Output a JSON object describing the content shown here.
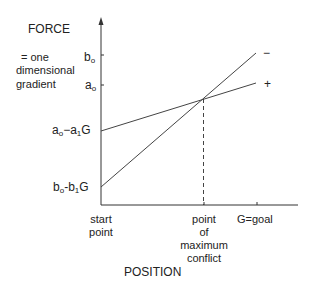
{
  "diagram": {
    "y_axis_title": "FORCE",
    "y_axis_subtitle": [
      "= one",
      "dimensional",
      "gradient"
    ],
    "x_axis_title": "POSITION",
    "y_ticks": {
      "b0": {
        "base": "b",
        "sub": "o"
      },
      "a0": {
        "base": "a",
        "sub": "o"
      },
      "a0_minus_a1G": {
        "p1": "a",
        "s1": "o",
        "mid": "−a",
        "s2": "1",
        "end": "G"
      },
      "b0_minus_b1G": {
        "p1": "b",
        "s1": "o",
        "mid": "-b",
        "s2": "1",
        "end": "G"
      }
    },
    "x_ticks": {
      "start": [
        "start",
        "point"
      ],
      "conflict": [
        "point",
        "of",
        "maximum",
        "conflict"
      ],
      "goal": "G=goal"
    },
    "lines": [
      {
        "name": "avoidance-gradient",
        "sign": "−",
        "from": "b0-b1G",
        "to": "b0"
      },
      {
        "name": "approach-gradient",
        "sign": "+",
        "from": "a0-a1G",
        "to": "a0"
      }
    ]
  }
}
